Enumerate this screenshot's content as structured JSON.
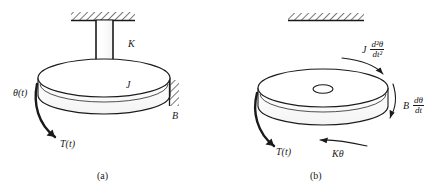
{
  "figure": {
    "type": "torsional-mechanical-system-diagram",
    "panels": [
      {
        "id": "a",
        "caption": "(a)",
        "description": "Physical schematic of a rotational mechanical system: a disk of inertia J suspended from a fixed ceiling by a torsional shaft of stiffness K, with viscous damping B against a fixed wall, driven by applied torque T(t) producing angular displacement theta(t).",
        "labels": {
          "stiffness": "K",
          "inertia": "J",
          "damping": "B",
          "angle": "θ(t)",
          "torque": "T(t)"
        }
      },
      {
        "id": "b",
        "caption": "(b)",
        "description": "Free-body diagram of the same disk showing the applied torque T(t) balanced by inertia, damping and spring reaction torques.",
        "labels": {
          "torque": "T(t)",
          "spring_torque": "Kθ"
        },
        "inertia_term": {
          "coefficient": "J",
          "numerator": "d²θ",
          "denominator": "dt²",
          "plain": "J d²θ/dt²"
        },
        "damping_term": {
          "coefficient": "B",
          "numerator": "dθ",
          "denominator": "dt",
          "plain": "B dθ/dt"
        }
      }
    ]
  },
  "colors": {
    "ink": "#1a1a1a",
    "line": "#333333",
    "background": "#ffffff",
    "hatch": "#555555"
  }
}
